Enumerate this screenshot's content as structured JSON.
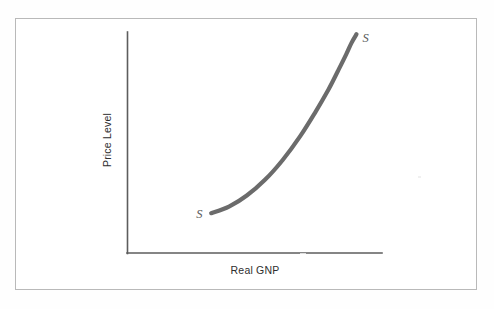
{
  "figure": {
    "background_color": "#fefefe",
    "frame_color": "#b9b9b9",
    "axis_color": "#5d5d5d",
    "curve_color": "#6b6b6b"
  },
  "chart_data": {
    "type": "line",
    "title": "",
    "subtitle": "",
    "xlabel": "Real GNP",
    "ylabel": "Price Level",
    "grid": false,
    "legend": "none",
    "axis_ticks": {
      "x": [],
      "y": []
    },
    "xlim": [
      0,
      1
    ],
    "ylim": [
      0,
      1
    ],
    "annotations": [
      {
        "text": "S",
        "position": "curve-start-lower-left",
        "style": "italic"
      },
      {
        "text": "S",
        "position": "curve-end-upper-right",
        "style": "italic"
      }
    ],
    "series": [
      {
        "name": "S",
        "description": "Aggregate supply curve, upward sloping and convex: flat at low output, nearly vertical near capacity",
        "x": [
          0.33,
          0.4,
          0.47,
          0.54,
          0.61,
          0.68,
          0.74,
          0.79,
          0.83,
          0.86,
          0.88,
          0.9
        ],
        "y": [
          0.18,
          0.21,
          0.26,
          0.33,
          0.42,
          0.53,
          0.64,
          0.74,
          0.83,
          0.9,
          0.95,
          0.99
        ]
      }
    ]
  }
}
